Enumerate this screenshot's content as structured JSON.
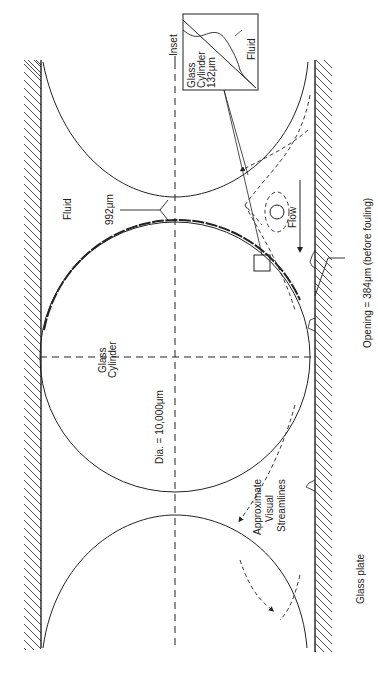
{
  "figure": {
    "orientation": "rotated -90deg (text reads bottom-to-top)",
    "labels": {
      "inset": "Inset",
      "inset_glass_line1": "Glass",
      "inset_glass_line2": "Cylinder",
      "inset_glass_line3": "132μm",
      "inset_fluid": "Fluid",
      "fluid": "Fluid",
      "gap": "992μm",
      "glass_cylinder_line1": "Glass",
      "glass_cylinder_line2": "Cylinder",
      "diameter": "Dia. = 10,000μm",
      "flow": "Flow",
      "opening": "Opening = 384μm (before fouling)",
      "streamlines_line1": "Approximate",
      "streamlines_line2": "Visual",
      "streamlines_line3": "Streamlines",
      "glass_plate": "Glass plate"
    },
    "colors": {
      "ink": "#222222",
      "background": "#ffffff"
    }
  }
}
